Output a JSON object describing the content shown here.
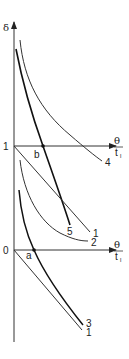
{
  "diagram": {
    "y_axis_label": "δ",
    "axes": [
      {
        "level_label": "1",
        "x_label_num": "θ",
        "x_label_den": "t",
        "x_label_den_sub": "l"
      },
      {
        "level_label": "0",
        "x_label_num": "θ",
        "x_label_den": "t",
        "x_label_den_sub": "l"
      }
    ],
    "points": [
      {
        "name": "b",
        "label": "b"
      },
      {
        "name": "a",
        "label": "a"
      }
    ],
    "curves": [
      {
        "id": "4",
        "label": "4"
      },
      {
        "id": "5",
        "label": "5"
      },
      {
        "id": "1-upper",
        "label": "1"
      },
      {
        "id": "2",
        "label": "2"
      },
      {
        "id": "3",
        "label": "3"
      },
      {
        "id": "1-lower",
        "label": "1"
      }
    ],
    "colors": {
      "line": "#333333",
      "thick_line": "#111111"
    }
  }
}
